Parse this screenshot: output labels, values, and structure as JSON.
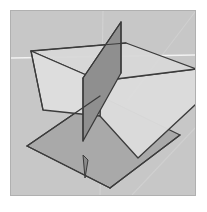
{
  "figure": {
    "type": "3d-geometry-illustration",
    "caption": ""
  },
  "canvas": {
    "width": 207,
    "height": 212,
    "page_background": "#ffffff"
  },
  "frame": {
    "name": "image-border",
    "x": 10,
    "y": 10,
    "width": 186,
    "height": 186,
    "fill": "#c8c8c8",
    "stroke": "#b0b0b0",
    "stroke_width": 1
  },
  "background": {
    "fill": "#c7c7c7",
    "gridlines": [
      {
        "name": "horizontal-highlight-line",
        "orientation": "horizontal",
        "x1": 11,
        "y1": 58,
        "x2": 195,
        "y2": 55,
        "color": "#f2f2f2",
        "width": 1.6
      },
      {
        "name": "vertical-gridline",
        "orientation": "vertical",
        "x1": 103,
        "y1": 11,
        "x2": 100,
        "y2": 195,
        "color": "#d2d2d2",
        "width": 1.1
      },
      {
        "name": "diagonal-gridline-upper-right",
        "orientation": "diagonal",
        "x1": 195,
        "y1": 12,
        "x2": 128,
        "y2": 100,
        "color": "#d0d0d0",
        "width": 1.1
      },
      {
        "name": "diagonal-gridline-lower-right",
        "orientation": "diagonal",
        "x1": 195,
        "y1": 128,
        "x2": 132,
        "y2": 195,
        "color": "#d0d0d0",
        "width": 1.1
      }
    ]
  },
  "planes": [
    {
      "name": "horizontal-plane-dark",
      "label": "xy-plane",
      "points": "27,146 100,96 180,135 110,188",
      "fill": "#a9a9a9",
      "fill_opacity": 1,
      "stroke": "#3c3c3c",
      "stroke_width": 1.3
    },
    {
      "name": "horizontal-plane-light",
      "label": "xz-plane",
      "points": "31,51 126,43 196,69 100,81",
      "fill": "#d8d8d8",
      "fill_opacity": 0.97,
      "stroke": "#3c3c3c",
      "stroke_width": 1.3
    },
    {
      "name": "horizontal-plane-light-front",
      "label": "xz-plane-front-band",
      "points": "31,51 100,81 100,116 43,110",
      "fill": "#dedede",
      "fill_opacity": 0.97,
      "stroke": "#3c3c3c",
      "stroke_width": 1.3
    },
    {
      "name": "horizontal-plane-light-right",
      "label": "xz-plane-right-band",
      "points": "100,81 196,69 196,104 138,158 100,116",
      "fill": "#dcdcdc",
      "fill_opacity": 0.97,
      "stroke": "#3c3c3c",
      "stroke_width": 1.3
    },
    {
      "name": "vertical-plane-dark",
      "label": "yz-plane",
      "points": "121,22 121,73 83,141 83,78",
      "fill": "#8f8f8f",
      "fill_opacity": 1,
      "stroke": "#3a3a3a",
      "stroke_width": 1.3
    },
    {
      "name": "vertical-plane-spike",
      "label": "yz-plane-lower-spike",
      "points": "83,155 88,160 85,178",
      "fill": "#8a8a8a",
      "fill_opacity": 1,
      "stroke": "#3a3a3a",
      "stroke_width": 1.0
    }
  ],
  "edges": [
    {
      "name": "vertical-plane-right-edge",
      "x1": 121,
      "y1": 22,
      "x2": 121,
      "y2": 73,
      "color": "#3a3a3a",
      "width": 1.2
    },
    {
      "name": "vertical-plane-left-edge",
      "x1": 83,
      "y1": 78,
      "x2": 83,
      "y2": 141,
      "color": "#3a3a3a",
      "width": 1.2
    },
    {
      "name": "vertical-plane-top-slope",
      "x1": 121,
      "y1": 22,
      "x2": 83,
      "y2": 78,
      "color": "#3a3a3a",
      "width": 1.2
    },
    {
      "name": "light-plane-left-edge",
      "x1": 31,
      "y1": 51,
      "x2": 43,
      "y2": 110,
      "color": "#3c3c3c",
      "width": 1.2
    },
    {
      "name": "light-plane-top-edge",
      "x1": 31,
      "y1": 51,
      "x2": 126,
      "y2": 43,
      "color": "#3c3c3c",
      "width": 1.2
    },
    {
      "name": "light-plane-right-edge",
      "x1": 196,
      "y1": 69,
      "x2": 196,
      "y2": 104,
      "color": "#3c3c3c",
      "width": 1.2
    },
    {
      "name": "dark-plane-left-corner",
      "x1": 27,
      "y1": 146,
      "x2": 100,
      "y2": 96,
      "color": "#3c3c3c",
      "width": 1.3
    },
    {
      "name": "dark-plane-bottom-edge",
      "x1": 27,
      "y1": 146,
      "x2": 110,
      "y2": 188,
      "color": "#3c3c3c",
      "width": 1.3
    },
    {
      "name": "dark-plane-right-edge",
      "x1": 110,
      "y1": 188,
      "x2": 180,
      "y2": 135,
      "color": "#3c3c3c",
      "width": 1.3
    }
  ],
  "colors": {
    "plane_dark": "#a9a9a9",
    "plane_light": "#d8d8d8",
    "plane_vertical": "#8f8f8f",
    "outline": "#3c3c3c",
    "background": "#c7c7c7",
    "frame_stroke": "#b0b0b0",
    "highlight_line": "#f2f2f2"
  }
}
